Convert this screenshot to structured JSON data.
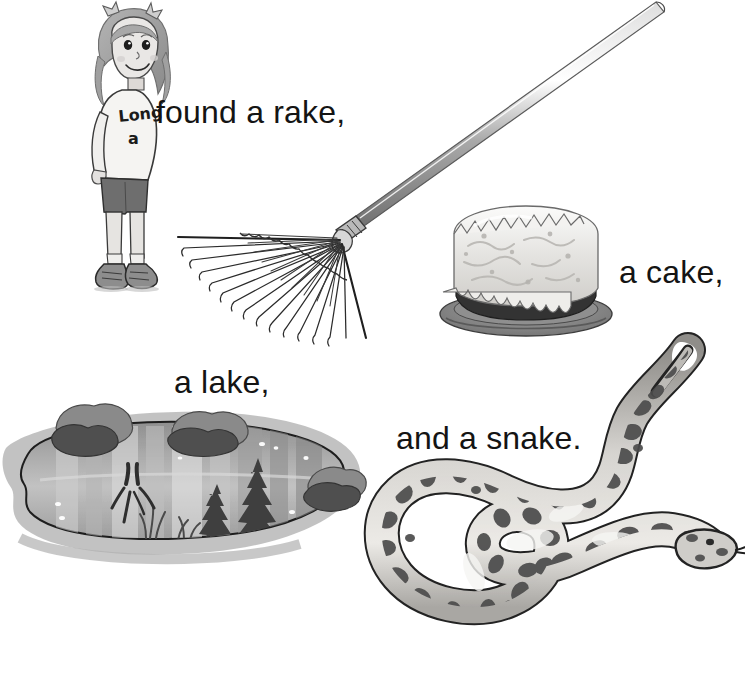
{
  "page": {
    "background_color": "#ffffff",
    "width": 745,
    "height": 683,
    "theme": "long-a phonics illustration page",
    "ink_color": "#141414"
  },
  "captions": {
    "rake": "found a rake,",
    "cake": "a cake,",
    "lake": "a lake,",
    "snake": "and a snake."
  },
  "girl": {
    "shirt_text_line1": "Long",
    "shirt_text_line2": "a",
    "label": "girl character",
    "hair_color": "#9a9a9a",
    "skin_color": "#e3e1df",
    "shirt_color": "#f4f3f1",
    "shorts_color": "#6e6e6e",
    "shoe_color": "#8d8d8d"
  },
  "illustrations": {
    "rake": {
      "name": "leaf rake",
      "tine_count": 21,
      "handle_color": "#b9b9b9",
      "tine_color": "#2b2b2b"
    },
    "cake": {
      "name": "frosted round cake on plate",
      "frosting_color": "#ededeb",
      "cake_color": "#3c3c3c",
      "plate_color": "#8e8e8e"
    },
    "lake": {
      "name": "lake with pine tree reflections",
      "water_color": "#9a9a9a",
      "shore_color": "#b5b5b5",
      "bush_color": "#5f5f5f",
      "tree_color": "#4a4a4a",
      "tree_count": 2
    },
    "snake": {
      "name": "spotted snake coiled in s-curve",
      "body_color": "#c9c7c3",
      "spot_color": "#4a4a4a",
      "outline_color": "#2a2a2a"
    }
  }
}
